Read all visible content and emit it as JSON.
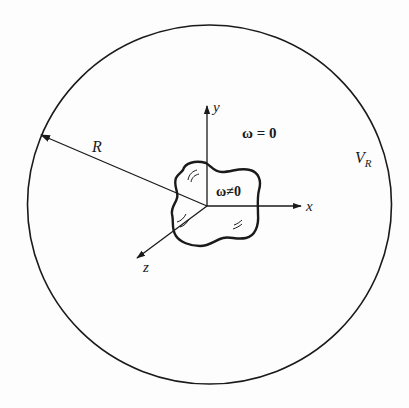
{
  "diagram": {
    "type": "vorticity-region-schematic",
    "colors": {
      "stroke": "#1a1a1a",
      "background": "#fdfdfd"
    },
    "outer_sphere": {
      "label": "V",
      "label_subscript": "R"
    },
    "radius_arrow": {
      "label": "R"
    },
    "axes": {
      "x": {
        "label": "x"
      },
      "y": {
        "label": "y"
      },
      "z": {
        "label": "z"
      }
    },
    "region_outside": {
      "label": "ω = 0"
    },
    "region_inside": {
      "label": "ω≠0"
    }
  }
}
